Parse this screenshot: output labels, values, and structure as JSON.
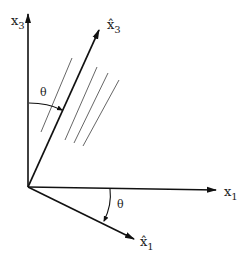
{
  "diagram": {
    "axes": {
      "x3": {
        "label": "x",
        "subscript": "3"
      },
      "x3_hat": {
        "label": "x̂",
        "subscript": "3"
      },
      "x1": {
        "label": "x",
        "subscript": "1"
      },
      "x1_hat": {
        "label": "x̂",
        "subscript": "1"
      }
    },
    "angle_top": "θ",
    "angle_bottom": "θ",
    "hatch_line_count": 4
  }
}
